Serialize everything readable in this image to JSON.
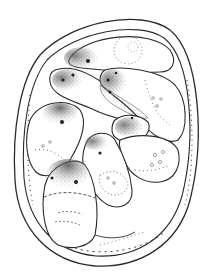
{
  "figure": {
    "kind": "stippled scientific line drawing",
    "colors": {
      "background": "#ffffff",
      "ink": "#2a2a2a",
      "stipple_dark": "#3a3a3a"
    },
    "bodies_count": 8
  }
}
